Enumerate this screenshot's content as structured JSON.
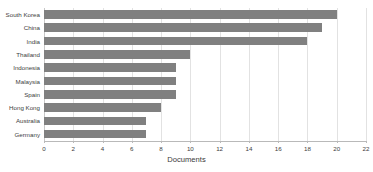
{
  "chart_data": {
    "type": "bar",
    "orientation": "horizontal",
    "title": "",
    "xlabel": "Documents",
    "ylabel": "",
    "xlim": [
      0,
      22
    ],
    "xticks": [
      0,
      2,
      4,
      6,
      8,
      10,
      12,
      14,
      16,
      18,
      20,
      22
    ],
    "grid": true,
    "legend": null,
    "bar_color": "#808080",
    "categories": [
      "South Korea",
      "China",
      "India",
      "Thailand",
      "Indonesia",
      "Malaysia",
      "Spain",
      "Hong Kong",
      "Australia",
      "Germany"
    ],
    "values": [
      20,
      19,
      18,
      10,
      9,
      9,
      9,
      8,
      7,
      7
    ]
  }
}
